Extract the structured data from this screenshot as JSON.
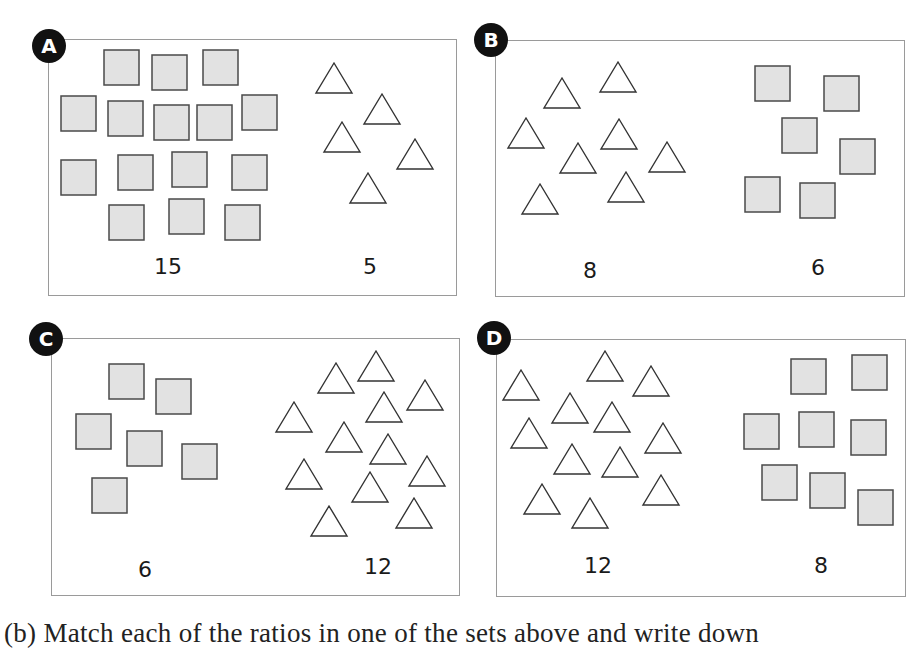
{
  "colors": {
    "square_fill": "#e2e2e2",
    "square_stroke": "#4a4a4a",
    "triangle_fill": "#ffffff",
    "triangle_stroke": "#333333",
    "panel_border": "#9a9a9a",
    "badge_bg": "#111111",
    "badge_text": "#ffffff"
  },
  "shape_sizes": {
    "square": 35,
    "triangle_width": 36,
    "triangle_height": 30
  },
  "panels": [
    {
      "id": "A",
      "badge": "A",
      "box": {
        "left": 48,
        "top": 39,
        "width": 409,
        "height": 257
      },
      "badge_pos": {
        "left": 32,
        "top": 29
      },
      "labels": [
        {
          "text": "15",
          "x": 168,
          "y": 254
        },
        {
          "text": "5",
          "x": 370,
          "y": 254
        }
      ],
      "squares": [
        [
          104,
          50
        ],
        [
          152,
          55
        ],
        [
          203,
          50
        ],
        [
          61,
          96
        ],
        [
          108,
          101
        ],
        [
          154,
          105
        ],
        [
          197,
          105
        ],
        [
          242,
          95
        ],
        [
          61,
          160
        ],
        [
          118,
          155
        ],
        [
          172,
          152
        ],
        [
          232,
          155
        ],
        [
          109,
          205
        ],
        [
          169,
          199
        ],
        [
          225,
          205
        ]
      ],
      "triangles": [
        [
          316,
          63
        ],
        [
          364,
          94
        ],
        [
          324,
          122
        ],
        [
          397,
          139
        ],
        [
          350,
          173
        ]
      ]
    },
    {
      "id": "B",
      "badge": "B",
      "box": {
        "left": 495,
        "top": 40,
        "width": 410,
        "height": 257
      },
      "badge_pos": {
        "left": 474,
        "top": 23
      },
      "labels": [
        {
          "text": "8",
          "x": 590,
          "y": 258
        },
        {
          "text": "6",
          "x": 818,
          "y": 255
        }
      ],
      "squares": [
        [
          755,
          66
        ],
        [
          824,
          76
        ],
        [
          782,
          118
        ],
        [
          840,
          139
        ],
        [
          745,
          177
        ],
        [
          800,
          183
        ]
      ],
      "triangles": [
        [
          544,
          78
        ],
        [
          600,
          62
        ],
        [
          508,
          118
        ],
        [
          601,
          119
        ],
        [
          560,
          143
        ],
        [
          649,
          142
        ],
        [
          522,
          184
        ],
        [
          608,
          172
        ]
      ]
    },
    {
      "id": "C",
      "badge": "C",
      "box": {
        "left": 51,
        "top": 338,
        "width": 409,
        "height": 258
      },
      "badge_pos": {
        "left": 29,
        "top": 322
      },
      "labels": [
        {
          "text": "6",
          "x": 145,
          "y": 557
        },
        {
          "text": "12",
          "x": 378,
          "y": 554
        }
      ],
      "squares": [
        [
          109,
          364
        ],
        [
          156,
          379
        ],
        [
          76,
          414
        ],
        [
          127,
          431
        ],
        [
          182,
          444
        ],
        [
          92,
          478
        ]
      ],
      "triangles": [
        [
          318,
          363
        ],
        [
          358,
          351
        ],
        [
          407,
          380
        ],
        [
          276,
          402
        ],
        [
          366,
          392
        ],
        [
          326,
          422
        ],
        [
          370,
          434
        ],
        [
          286,
          459
        ],
        [
          409,
          456
        ],
        [
          352,
          472
        ],
        [
          311,
          506
        ],
        [
          396,
          498
        ]
      ]
    },
    {
      "id": "D",
      "badge": "D",
      "box": {
        "left": 496,
        "top": 339,
        "width": 410,
        "height": 258
      },
      "badge_pos": {
        "left": 477,
        "top": 321
      },
      "labels": [
        {
          "text": "12",
          "x": 598,
          "y": 553
        },
        {
          "text": "8",
          "x": 821,
          "y": 553
        }
      ],
      "squares": [
        [
          791,
          359
        ],
        [
          852,
          355
        ],
        [
          744,
          414
        ],
        [
          799,
          412
        ],
        [
          851,
          420
        ],
        [
          762,
          465
        ],
        [
          810,
          473
        ],
        [
          858,
          490
        ]
      ],
      "triangles": [
        [
          503,
          370
        ],
        [
          587,
          351
        ],
        [
          633,
          366
        ],
        [
          552,
          393
        ],
        [
          594,
          402
        ],
        [
          511,
          418
        ],
        [
          645,
          423
        ],
        [
          554,
          444
        ],
        [
          602,
          447
        ],
        [
          643,
          475
        ],
        [
          524,
          484
        ],
        [
          572,
          498
        ]
      ]
    }
  ],
  "question": {
    "text": "(b)  Match each of the ratios in one of the sets above and write down"
  }
}
